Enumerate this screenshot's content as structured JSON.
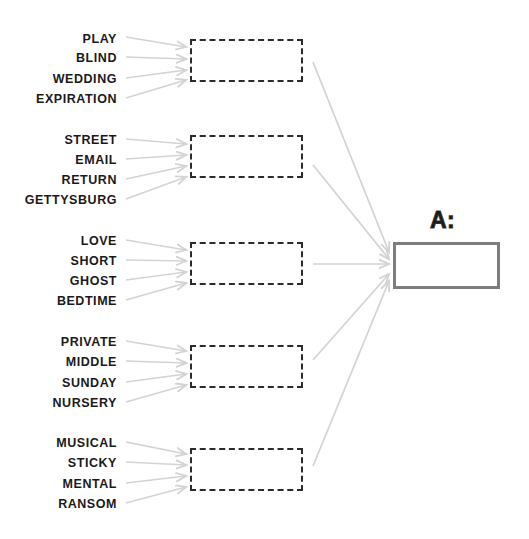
{
  "canvas": {
    "width": 529,
    "height": 539,
    "background_color": "#ffffff",
    "word_color": "#1a1a1a",
    "arrow_color": "#d3d3d3",
    "dashed_border_color": "#2b2b2b",
    "answer_border_color": "#7d7d7d"
  },
  "answer": {
    "label": "A:",
    "value": "",
    "box": {
      "x": 393,
      "y": 242,
      "width": 107,
      "height": 47
    },
    "label_x": 430,
    "label_y": 209
  },
  "groups": [
    {
      "name": "group-1",
      "slot": {
        "x": 190,
        "y": 39,
        "width": 113,
        "height": 43
      },
      "words": [
        {
          "text": "PLAY",
          "x": 117,
          "y": 39
        },
        {
          "text": "BLIND",
          "x": 117,
          "y": 58
        },
        {
          "text": "WEDDING",
          "x": 117,
          "y": 79
        },
        {
          "text": "EXPIRATION",
          "x": 117,
          "y": 99
        }
      ]
    },
    {
      "name": "group-2",
      "slot": {
        "x": 190,
        "y": 135,
        "width": 113,
        "height": 43
      },
      "words": [
        {
          "text": "STREET",
          "x": 117,
          "y": 140
        },
        {
          "text": "EMAIL",
          "x": 117,
          "y": 160
        },
        {
          "text": "RETURN",
          "x": 117,
          "y": 180
        },
        {
          "text": "GETTYSBURG",
          "x": 117,
          "y": 200
        }
      ]
    },
    {
      "name": "group-3",
      "slot": {
        "x": 190,
        "y": 242,
        "width": 113,
        "height": 43
      },
      "words": [
        {
          "text": "LOVE",
          "x": 117,
          "y": 241
        },
        {
          "text": "SHORT",
          "x": 117,
          "y": 261
        },
        {
          "text": "GHOST",
          "x": 117,
          "y": 281
        },
        {
          "text": "BEDTIME",
          "x": 117,
          "y": 301
        }
      ]
    },
    {
      "name": "group-4",
      "slot": {
        "x": 190,
        "y": 345,
        "width": 113,
        "height": 43
      },
      "words": [
        {
          "text": "PRIVATE",
          "x": 117,
          "y": 342
        },
        {
          "text": "MIDDLE",
          "x": 117,
          "y": 362
        },
        {
          "text": "SUNDAY",
          "x": 117,
          "y": 383
        },
        {
          "text": "NURSERY",
          "x": 117,
          "y": 403
        }
      ]
    },
    {
      "name": "group-5",
      "slot": {
        "x": 190,
        "y": 448,
        "width": 113,
        "height": 43
      },
      "words": [
        {
          "text": "MUSICAL",
          "x": 117,
          "y": 443
        },
        {
          "text": "STICKY",
          "x": 117,
          "y": 463
        },
        {
          "text": "MENTAL",
          "x": 117,
          "y": 484
        },
        {
          "text": "RANSOM",
          "x": 117,
          "y": 504
        }
      ]
    }
  ],
  "word_arrows": [
    {
      "x1": 126,
      "y1": 37,
      "x2": 186,
      "y2": 47
    },
    {
      "x1": 126,
      "y1": 57,
      "x2": 186,
      "y2": 59
    },
    {
      "x1": 126,
      "y1": 78,
      "x2": 186,
      "y2": 70
    },
    {
      "x1": 126,
      "y1": 98,
      "x2": 186,
      "y2": 80
    },
    {
      "x1": 126,
      "y1": 139,
      "x2": 186,
      "y2": 144
    },
    {
      "x1": 126,
      "y1": 159,
      "x2": 186,
      "y2": 155
    },
    {
      "x1": 126,
      "y1": 179,
      "x2": 186,
      "y2": 166
    },
    {
      "x1": 126,
      "y1": 199,
      "x2": 186,
      "y2": 177
    },
    {
      "x1": 126,
      "y1": 240,
      "x2": 186,
      "y2": 250
    },
    {
      "x1": 126,
      "y1": 260,
      "x2": 186,
      "y2": 261
    },
    {
      "x1": 126,
      "y1": 280,
      "x2": 186,
      "y2": 272
    },
    {
      "x1": 126,
      "y1": 300,
      "x2": 186,
      "y2": 283
    },
    {
      "x1": 126,
      "y1": 341,
      "x2": 186,
      "y2": 351
    },
    {
      "x1": 126,
      "y1": 361,
      "x2": 186,
      "y2": 363
    },
    {
      "x1": 126,
      "y1": 382,
      "x2": 186,
      "y2": 374
    },
    {
      "x1": 126,
      "y1": 402,
      "x2": 186,
      "y2": 385
    },
    {
      "x1": 126,
      "y1": 442,
      "x2": 186,
      "y2": 454
    },
    {
      "x1": 126,
      "y1": 462,
      "x2": 186,
      "y2": 465
    },
    {
      "x1": 126,
      "y1": 483,
      "x2": 186,
      "y2": 476
    },
    {
      "x1": 126,
      "y1": 503,
      "x2": 186,
      "y2": 487
    }
  ],
  "slot_arrows": [
    {
      "x1": 313,
      "y1": 62,
      "x2": 389,
      "y2": 252
    },
    {
      "x1": 313,
      "y1": 165,
      "x2": 389,
      "y2": 259
    },
    {
      "x1": 313,
      "y1": 264,
      "x2": 389,
      "y2": 264
    },
    {
      "x1": 313,
      "y1": 360,
      "x2": 389,
      "y2": 274
    },
    {
      "x1": 313,
      "y1": 466,
      "x2": 389,
      "y2": 281
    }
  ]
}
